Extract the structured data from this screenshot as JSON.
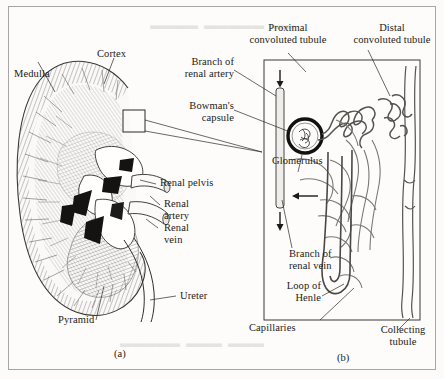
{
  "figure": {
    "panel_a_caption": "(a)",
    "panel_b_caption": "(b)",
    "panel_a_title": "kidney-cross-section",
    "panel_b_title": "nephron-diagram"
  },
  "kidney_labels": {
    "medulla": "Medulla",
    "cortex": "Cortex",
    "renal_pelvis": "Renal pelvis",
    "renal_artery": "Renal\nartery",
    "renal_vein": "Renal\nvein",
    "ureter": "Ureter",
    "pyramid": "Pyramid"
  },
  "nephron_labels": {
    "branch_renal_artery": "Branch of\nrenal artery",
    "bowmans_capsule": "Bowman's\ncapsule",
    "proximal_convoluted_tubule": "Proximal\nconvoluted tubule",
    "distal_convoluted_tubule": "Distal\nconvoluted tubule",
    "glomerulus": "Glomerulus",
    "branch_renal_vein": "Branch of\nrenal vein",
    "loop_of_henle": "Loop of\nHenle",
    "capillaries": "Capillaries",
    "collecting_tubule": "Collecting\ntubule"
  },
  "colors": {
    "paper": "#fdfcfa",
    "ink": "#1b1a18",
    "leader": "#2a2825",
    "frame": "#a8a6a2",
    "hatch": "#555350",
    "dark_fill": "#141312"
  }
}
